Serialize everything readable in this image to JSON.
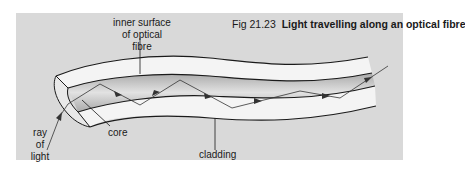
{
  "figure": {
    "number": "Fig 21.23",
    "title": "Light travelling along an optical fibre"
  },
  "labels": {
    "inner_surface_line1": "inner surface",
    "inner_surface_line2": "of optical fibre",
    "ray_line1": "ray of",
    "ray_line2": "light",
    "core": "core",
    "cladding": "cladding"
  },
  "colors": {
    "background": "#d9d9d9",
    "cladding": "#f4f4f4",
    "core": "#bdbdbd",
    "outline": "#1a1a1a"
  }
}
